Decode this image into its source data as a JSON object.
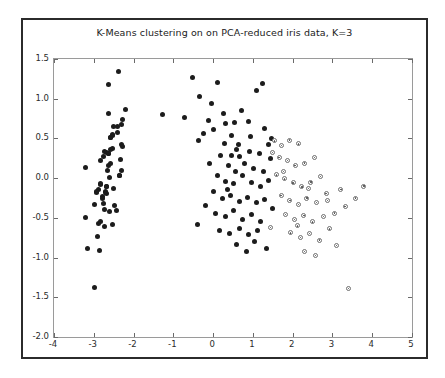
{
  "figure": {
    "title": "K-Means clustering on on PCA-reduced iris data, K=3",
    "background": "#ffffff",
    "border_color": "#2b2b2b"
  },
  "chart_data": {
    "type": "scatter",
    "title": "K-Means clustering on on PCA-reduced iris data, K=3",
    "xlabel": "",
    "ylabel": "",
    "xlim": [
      -4,
      5
    ],
    "ylim": [
      -2.0,
      1.5
    ],
    "xticks": [
      -4,
      -3,
      -2,
      -1,
      0,
      1,
      2,
      3,
      4,
      5
    ],
    "yticks": [
      -2.0,
      -1.5,
      -1.0,
      -0.5,
      0.0,
      0.5,
      1.0,
      1.5
    ],
    "xticklabels": [
      "-4",
      "-3",
      "-2",
      "-1",
      "0",
      "1",
      "2",
      "3",
      "4",
      "5"
    ],
    "yticklabels": [
      "-2.0",
      "-1.5",
      "-1.0",
      "-0.5",
      "0.0",
      "0.5",
      "1.0",
      "1.5"
    ],
    "grid": false,
    "legend": null,
    "marker_colors": {
      "cluster_solid": "#1c1c1c",
      "cluster_open_edge": "#6e6e6e",
      "cluster_open_face": "#ffffff"
    },
    "series": [
      {
        "name": "cluster-0",
        "marker": "filled-circle",
        "points": [
          [
            -2.68,
            0.32
          ],
          [
            -2.71,
            -0.18
          ],
          [
            -2.89,
            -0.14
          ],
          [
            -2.75,
            -0.32
          ],
          [
            -2.73,
            0.33
          ],
          [
            -2.28,
            0.74
          ],
          [
            -2.82,
            -0.08
          ],
          [
            -2.62,
            0.16
          ],
          [
            -2.88,
            -0.57
          ],
          [
            -2.67,
            -0.11
          ],
          [
            -2.5,
            0.65
          ],
          [
            -2.61,
            0.01
          ],
          [
            -2.78,
            -0.23
          ],
          [
            -3.22,
            -0.5
          ],
          [
            -2.64,
            1.18
          ],
          [
            -2.38,
            1.34
          ],
          [
            -2.62,
            0.81
          ],
          [
            -2.64,
            0.31
          ],
          [
            -2.19,
            0.87
          ],
          [
            -2.58,
            0.51
          ],
          [
            -2.31,
            0.42
          ],
          [
            -2.54,
            0.37
          ],
          [
            -3.21,
            0.13
          ],
          [
            -2.3,
            0.1
          ],
          [
            -2.35,
            0.03
          ],
          [
            -2.5,
            -0.13
          ],
          [
            -2.35,
            0.03
          ],
          [
            -2.59,
            0.36
          ],
          [
            -2.63,
            0.31
          ],
          [
            -2.7,
            -0.17
          ],
          [
            -2.67,
            -0.19
          ],
          [
            -2.32,
            0.24
          ],
          [
            -2.53,
            0.54
          ],
          [
            -2.4,
            0.65
          ],
          [
            -2.67,
            -0.11
          ],
          [
            -2.83,
            -0.07
          ],
          [
            -2.59,
            0.51
          ],
          [
            -2.83,
            0.22
          ],
          [
            -2.99,
            -0.33
          ],
          [
            -2.59,
            0.19
          ],
          [
            -2.76,
            0.27
          ],
          [
            -3.17,
            -0.89
          ],
          [
            -2.93,
            -0.18
          ],
          [
            -2.29,
            0.4
          ],
          [
            -2.31,
            0.67
          ],
          [
            -2.79,
            -0.26
          ],
          [
            -2.41,
            0.58
          ],
          [
            -2.92,
            -0.17
          ],
          [
            -2.53,
            0.55
          ],
          [
            -2.66,
            0.1
          ],
          [
            -2.98,
            -1.38
          ],
          [
            -2.53,
            -0.58
          ],
          [
            -2.86,
            -0.91
          ],
          [
            -2.83,
            -0.55
          ],
          [
            -2.73,
            -0.61
          ],
          [
            -2.49,
            -0.34
          ],
          [
            -2.6,
            -0.42
          ],
          [
            -2.9,
            -0.73
          ],
          [
            -2.74,
            -0.4
          ],
          [
            -2.44,
            -0.41
          ]
        ]
      },
      {
        "name": "cluster-1",
        "marker": "filled-circle",
        "points": [
          [
            -0.52,
            1.27
          ],
          [
            -0.35,
            1.03
          ],
          [
            -0.72,
            0.76
          ],
          [
            -1.28,
            0.8
          ],
          [
            0.12,
            1.2
          ],
          [
            0.31,
            0.69
          ],
          [
            0.53,
            0.7
          ],
          [
            -0.05,
            0.94
          ],
          [
            -0.37,
            0.47
          ],
          [
            -0.23,
            0.56
          ],
          [
            0.02,
            0.61
          ],
          [
            0.28,
            0.43
          ],
          [
            0.63,
            0.42
          ],
          [
            0.88,
            0.71
          ],
          [
            1.09,
            1.1
          ],
          [
            1.24,
            1.19
          ],
          [
            0.46,
            0.29
          ],
          [
            0.67,
            0.27
          ],
          [
            0.92,
            0.33
          ],
          [
            1.16,
            0.31
          ],
          [
            1.39,
            0.42
          ],
          [
            0.18,
            0.28
          ],
          [
            0.38,
            0.16
          ],
          [
            0.57,
            0.08
          ],
          [
            0.8,
            0.18
          ],
          [
            1.02,
            0.12
          ],
          [
            1.27,
            0.08
          ],
          [
            1.44,
            0.25
          ],
          [
            -0.08,
            0.19
          ],
          [
            0.11,
            0.03
          ],
          [
            0.32,
            -0.04
          ],
          [
            0.52,
            -0.07
          ],
          [
            0.74,
            0.03
          ],
          [
            0.97,
            -0.05
          ],
          [
            1.19,
            -0.11
          ],
          [
            1.38,
            -0.03
          ],
          [
            0.01,
            -0.17
          ],
          [
            0.23,
            -0.26
          ],
          [
            0.44,
            -0.22
          ],
          [
            0.66,
            -0.29
          ],
          [
            0.86,
            -0.24
          ],
          [
            1.08,
            -0.31
          ],
          [
            1.3,
            -0.27
          ],
          [
            -0.18,
            -0.35
          ],
          [
            0.07,
            -0.44
          ],
          [
            0.3,
            -0.48
          ],
          [
            0.52,
            -0.41
          ],
          [
            0.75,
            -0.52
          ],
          [
            0.96,
            -0.46
          ],
          [
            1.19,
            -0.54
          ],
          [
            -0.4,
            -0.58
          ],
          [
            0.16,
            -0.66
          ],
          [
            0.41,
            -0.7
          ],
          [
            0.66,
            -0.63
          ],
          [
            0.89,
            -0.71
          ],
          [
            1.12,
            -0.66
          ],
          [
            0.6,
            -0.84
          ],
          [
            0.85,
            -0.92
          ],
          [
            1.05,
            -0.8
          ],
          [
            1.33,
            -0.88
          ],
          [
            0.47,
            0.54
          ],
          [
            0.95,
            0.52
          ],
          [
            1.3,
            0.62
          ],
          [
            0.72,
            0.85
          ],
          [
            0.25,
            0.82
          ],
          [
            -0.12,
            0.72
          ],
          [
            1.48,
            0.5
          ],
          [
            1.5,
            -0.38
          ],
          [
            0.36,
            -0.14
          ],
          [
            0.6,
            0.36
          ]
        ]
      },
      {
        "name": "cluster-2",
        "marker": "open-circle",
        "points": [
          [
            1.55,
            0.47
          ],
          [
            1.72,
            0.41
          ],
          [
            1.92,
            0.48
          ],
          [
            2.15,
            0.43
          ],
          [
            1.66,
            0.26
          ],
          [
            1.87,
            0.22
          ],
          [
            2.06,
            0.16
          ],
          [
            2.3,
            0.19
          ],
          [
            2.55,
            0.26
          ],
          [
            1.59,
            0.04
          ],
          [
            1.8,
            -0.01
          ],
          [
            2.01,
            -0.06
          ],
          [
            2.23,
            -0.11
          ],
          [
            2.46,
            -0.05
          ],
          [
            2.7,
            0.02
          ],
          [
            1.71,
            -0.22
          ],
          [
            1.93,
            -0.28
          ],
          [
            2.14,
            -0.33
          ],
          [
            2.36,
            -0.25
          ],
          [
            2.6,
            -0.31
          ],
          [
            1.82,
            -0.46
          ],
          [
            2.05,
            -0.52
          ],
          [
            2.28,
            -0.47
          ],
          [
            2.5,
            -0.55
          ],
          [
            2.77,
            -0.48
          ],
          [
            1.95,
            -0.69
          ],
          [
            2.19,
            -0.75
          ],
          [
            2.43,
            -0.7
          ],
          [
            2.68,
            -0.78
          ],
          [
            2.92,
            -0.64
          ],
          [
            2.3,
            -0.92
          ],
          [
            2.57,
            -0.97
          ],
          [
            3.05,
            -0.44
          ],
          [
            3.32,
            -0.36
          ],
          [
            3.58,
            -0.25
          ],
          [
            3.79,
            -0.1
          ],
          [
            3.1,
            -0.85
          ],
          [
            3.41,
            -1.39
          ],
          [
            2.84,
            -0.19
          ],
          [
            3.21,
            -0.14
          ],
          [
            1.5,
            0.32
          ],
          [
            1.44,
            -0.62
          ],
          [
            2.12,
            -0.6
          ],
          [
            2.4,
            -0.13
          ],
          [
            1.77,
            0.08
          ],
          [
            2.88,
            -0.28
          ]
        ]
      }
    ]
  }
}
